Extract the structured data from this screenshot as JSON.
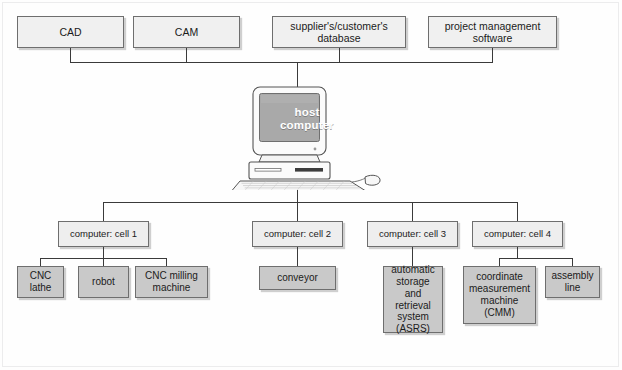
{
  "diagram": {
    "type": "hierarchy-tree",
    "colors": {
      "line": "#3a3a3a",
      "top_box_fill": "#f0f0f0",
      "cell_box_fill": "#eeeeee",
      "leaf_box_fill": "#c9c9c9",
      "box_border": "#6e6e6e",
      "screen_fill": "#a9a9a9",
      "background": "#ffffff"
    }
  },
  "top_row": [
    {
      "label": "CAD"
    },
    {
      "label": "CAM"
    },
    {
      "label": "supplier's/customer's database"
    },
    {
      "label": "project management software"
    }
  ],
  "host": {
    "label_line1": "host",
    "label_line2": "computer",
    "icon": "desktop-computer-icon"
  },
  "cells": [
    {
      "label": "computer: cell 1",
      "children": [
        {
          "label": "CNC lathe"
        },
        {
          "label": "robot"
        },
        {
          "label": "CNC milling machine"
        }
      ]
    },
    {
      "label": "computer: cell 2",
      "children": [
        {
          "label": "conveyor"
        }
      ]
    },
    {
      "label": "computer: cell 3",
      "children": [
        {
          "label": "automatic storage and retrieval system (ASRS)"
        }
      ]
    },
    {
      "label": "computer: cell 4",
      "children": [
        {
          "label": "coordinate measurement machine (CMM)"
        },
        {
          "label": "assembly line"
        }
      ]
    }
  ]
}
